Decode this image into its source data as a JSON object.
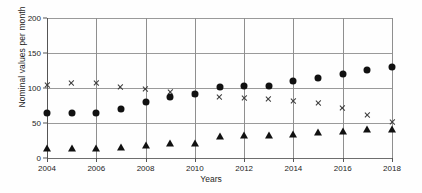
{
  "chart_data": {
    "type": "scatter",
    "title": "",
    "xlabel": "Years",
    "ylabel": "Nominal values per month",
    "x": [
      2004,
      2005,
      2006,
      2007,
      2008,
      2009,
      2010,
      2011,
      2012,
      2013,
      2014,
      2015,
      2016,
      2017,
      2018
    ],
    "xlim": [
      2004,
      2018
    ],
    "ylim": [
      0,
      200
    ],
    "xticks": [
      2004,
      2006,
      2008,
      2010,
      2012,
      2014,
      2016,
      2018
    ],
    "xtick_labels": [
      "2004",
      "2006",
      "2008",
      "2010",
      "2012",
      "2014",
      "2016",
      "2018"
    ],
    "yticks": [
      0,
      50,
      100,
      150,
      200
    ],
    "ytick_labels": [
      "0",
      "50",
      "100",
      "150",
      "200"
    ],
    "grid": "horizontal-and-vertical",
    "legend": "none",
    "series": [
      {
        "name": "cross-series",
        "marker": "x",
        "color": "#3a3a3a",
        "values": [
          105,
          117,
          127,
          132,
          139,
          145,
          152,
          157,
          166,
          174,
          181,
          189,
          192,
          192,
          192
        ]
      },
      {
        "name": "circle-series",
        "marker": "circle",
        "color": "#111111",
        "values": [
          65,
          65,
          65,
          70,
          80,
          87,
          91,
          101,
          103,
          103,
          110,
          114,
          120,
          126,
          130
        ]
      },
      {
        "name": "triangle-series",
        "marker": "triangle",
        "color": "#111111",
        "values": [
          14,
          14,
          14,
          16,
          19,
          21,
          22,
          31,
          33,
          33,
          34,
          37,
          38,
          41,
          42
        ]
      }
    ]
  }
}
